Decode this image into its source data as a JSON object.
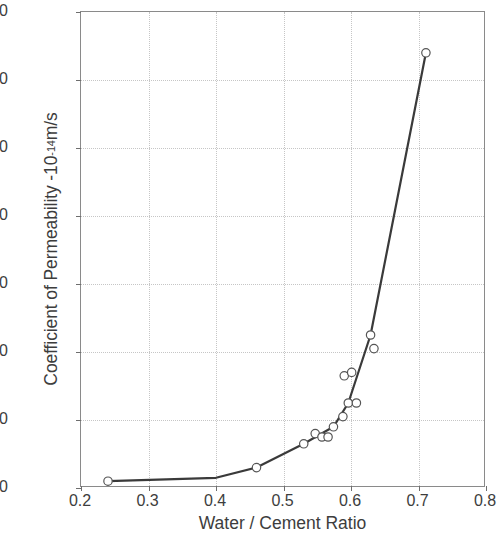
{
  "chart_data": {
    "type": "scatter",
    "title": "",
    "xlabel": "Water / Cement Ratio",
    "ylabel_text": "Coefficient of Permeability -10",
    "ylabel_exponent": "-14",
    "ylabel_units": " m/s",
    "ylabel_full": "Coefficient of Permeability -10-14 m/s",
    "xlim": [
      0.2,
      0.8
    ],
    "ylim": [
      0,
      140
    ],
    "xticks": [
      0.2,
      0.3,
      0.4,
      0.5,
      0.6,
      0.7,
      0.8
    ],
    "xtick_labels": [
      "0.2",
      "0.3",
      "0.4",
      "0.5",
      "0.6",
      "0.7",
      "0.8"
    ],
    "yticks": [
      0,
      20,
      40,
      60,
      80,
      100,
      120,
      140
    ],
    "ytick_labels": [
      "0",
      "20",
      "40",
      "60",
      "80",
      "100",
      "120",
      "140"
    ],
    "grid": true,
    "legend": null,
    "marker": "open-circle",
    "marker_size": 4.2,
    "line_color": "#3a3a3a",
    "marker_edge_color": "#555555",
    "marker_fill_color": "#ffffff",
    "grid_color": "#c6c6c6",
    "axis_color": "#8a8a8a",
    "points": [
      {
        "x": 0.24,
        "y": 2
      },
      {
        "x": 0.46,
        "y": 6
      },
      {
        "x": 0.53,
        "y": 13
      },
      {
        "x": 0.547,
        "y": 16
      },
      {
        "x": 0.557,
        "y": 15
      },
      {
        "x": 0.566,
        "y": 15
      },
      {
        "x": 0.574,
        "y": 18
      },
      {
        "x": 0.588,
        "y": 21
      },
      {
        "x": 0.596,
        "y": 25
      },
      {
        "x": 0.59,
        "y": 33
      },
      {
        "x": 0.601,
        "y": 34
      },
      {
        "x": 0.608,
        "y": 25
      },
      {
        "x": 0.629,
        "y": 45
      },
      {
        "x": 0.634,
        "y": 41
      },
      {
        "x": 0.711,
        "y": 128
      }
    ],
    "line_path": [
      {
        "x": 0.24,
        "y": 2
      },
      {
        "x": 0.4,
        "y": 3
      },
      {
        "x": 0.46,
        "y": 6
      },
      {
        "x": 0.53,
        "y": 13
      },
      {
        "x": 0.574,
        "y": 18
      },
      {
        "x": 0.596,
        "y": 25
      },
      {
        "x": 0.629,
        "y": 45
      },
      {
        "x": 0.711,
        "y": 128
      }
    ]
  }
}
